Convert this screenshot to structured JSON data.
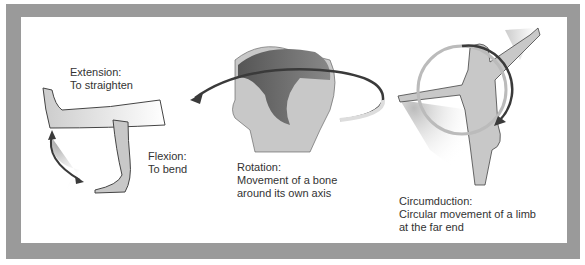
{
  "diagram": {
    "panels": [
      {
        "id": "extension-flexion",
        "labels": [
          {
            "title": "Extension:",
            "desc": "To straighten"
          },
          {
            "title": "Flexion:",
            "desc": "To bend"
          }
        ]
      },
      {
        "id": "rotation",
        "labels": [
          {
            "title": "Rotation:",
            "desc1": "Movement of a bone",
            "desc2": "around its own axis"
          }
        ]
      },
      {
        "id": "circumduction",
        "labels": [
          {
            "title": "Circumduction:",
            "desc1": "Circular movement of a limb",
            "desc2": "at the far end"
          }
        ]
      }
    ],
    "colors": {
      "frame": "#9a9a9a",
      "skin": "#c8c8c8",
      "outline": "#444444",
      "arrow": "#3a3a3a",
      "hair": "#6a6a6a"
    }
  }
}
